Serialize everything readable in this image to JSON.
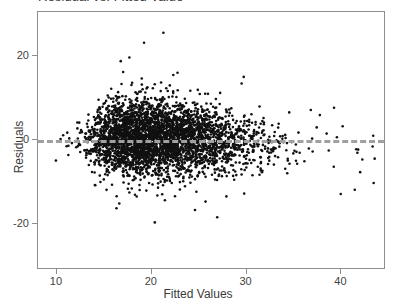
{
  "chart_data": {
    "type": "scatter",
    "title": "Residual vs. Fitted Value",
    "xlabel": "Fitted Values",
    "ylabel": "Residuals",
    "xlim": [
      8.0,
      44.7
    ],
    "ylim": [
      -31.0,
      30.5
    ],
    "xticks": [
      10,
      20,
      30,
      40
    ],
    "xticklabels": [
      "10",
      "20",
      "30",
      "40"
    ],
    "yticks": [
      20,
      0,
      -20
    ],
    "yticklabels": [
      "20",
      "0",
      "-20"
    ],
    "grid": false,
    "legend": null,
    "marker": {
      "shape": "circle",
      "color": "#111111",
      "size_px": 2.6,
      "opacity": 1
    },
    "reference_line": {
      "kind": "horizontal",
      "y": 0,
      "style": "dashed",
      "color": "#a0a0a0",
      "width_px": 3,
      "dash": "8 6"
    },
    "axes": {
      "frame": true,
      "frame_color": "#8e8e8e",
      "background": "#ffffff"
    },
    "n_points": 3600,
    "series": [
      {
        "name": "residuals",
        "description": "Heteroscedastic residual cloud, dense between fitted 13 and 27, right-skewed sparse tail to 44, spread widest near fitted 17-24.",
        "density_profile": [
          {
            "x": 9.8,
            "weight": 2,
            "spread": 1.2,
            "center": -0.2
          },
          {
            "x": 11.0,
            "weight": 6,
            "spread": 1.8,
            "center": -0.3
          },
          {
            "x": 12.0,
            "weight": 18,
            "spread": 2.4,
            "center": -0.2
          },
          {
            "x": 13.0,
            "weight": 55,
            "spread": 3.0,
            "center": -0.1
          },
          {
            "x": 14.0,
            "weight": 130,
            "spread": 3.6,
            "center": 0.0
          },
          {
            "x": 15.0,
            "weight": 215,
            "spread": 4.0,
            "center": 0.1
          },
          {
            "x": 16.0,
            "weight": 280,
            "spread": 4.2,
            "center": 0.2
          },
          {
            "x": 17.0,
            "weight": 315,
            "spread": 4.4,
            "center": 0.2
          },
          {
            "x": 18.0,
            "weight": 330,
            "spread": 4.5,
            "center": 0.2
          },
          {
            "x": 19.0,
            "weight": 325,
            "spread": 4.5,
            "center": 0.2
          },
          {
            "x": 20.0,
            "weight": 310,
            "spread": 4.5,
            "center": 0.1
          },
          {
            "x": 21.0,
            "weight": 290,
            "spread": 4.4,
            "center": 0.1
          },
          {
            "x": 22.0,
            "weight": 265,
            "spread": 4.3,
            "center": 0.0
          },
          {
            "x": 23.0,
            "weight": 235,
            "spread": 4.2,
            "center": 0.0
          },
          {
            "x": 24.0,
            "weight": 205,
            "spread": 4.1,
            "center": -0.1
          },
          {
            "x": 25.0,
            "weight": 175,
            "spread": 4.0,
            "center": -0.1
          },
          {
            "x": 26.0,
            "weight": 145,
            "spread": 3.9,
            "center": -0.2
          },
          {
            "x": 27.0,
            "weight": 115,
            "spread": 3.8,
            "center": -0.3
          },
          {
            "x": 28.0,
            "weight": 88,
            "spread": 3.7,
            "center": -0.4
          },
          {
            "x": 29.0,
            "weight": 66,
            "spread": 3.6,
            "center": -0.5
          },
          {
            "x": 30.0,
            "weight": 48,
            "spread": 3.6,
            "center": -0.7
          },
          {
            "x": 31.0,
            "weight": 34,
            "spread": 3.5,
            "center": -0.9
          },
          {
            "x": 32.0,
            "weight": 24,
            "spread": 3.5,
            "center": -1.1
          },
          {
            "x": 33.0,
            "weight": 17,
            "spread": 3.5,
            "center": -1.3
          },
          {
            "x": 34.0,
            "weight": 12,
            "spread": 3.4,
            "center": -1.6
          },
          {
            "x": 35.0,
            "weight": 8,
            "spread": 3.4,
            "center": -1.9
          },
          {
            "x": 36.0,
            "weight": 5,
            "spread": 3.3,
            "center": -2.2
          },
          {
            "x": 37.5,
            "weight": 4,
            "spread": 3.3,
            "center": -2.6
          },
          {
            "x": 39.0,
            "weight": 4,
            "spread": 3.8,
            "center": -2.6
          },
          {
            "x": 40.5,
            "weight": 3,
            "spread": 3.6,
            "center": -3.4
          },
          {
            "x": 42.0,
            "weight": 3,
            "spread": 3.5,
            "center": -4.6
          },
          {
            "x": 43.5,
            "weight": 2,
            "spread": 3.0,
            "center": -5.0
          }
        ],
        "notable_points": [
          {
            "x": 21.3,
            "y": 25.5,
            "note": "extreme positive outlier"
          },
          {
            "x": 39.4,
            "y": 7.5,
            "note": "isolated positive outlier far right"
          },
          {
            "x": 31.5,
            "y": 7.8,
            "note": "upper right outlier"
          },
          {
            "x": 9.9,
            "y": -5.2,
            "note": "left-most low point"
          },
          {
            "x": 24.8,
            "y": -12.7,
            "note": "low outlier"
          },
          {
            "x": 41.6,
            "y": -12.2,
            "note": "low outlier far right"
          },
          {
            "x": 43.6,
            "y": -10.6,
            "note": "right-most point"
          }
        ]
      }
    ]
  }
}
